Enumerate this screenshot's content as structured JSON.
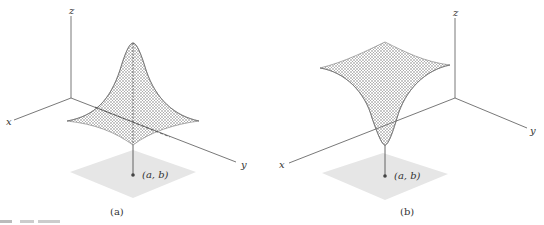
{
  "figure": {
    "panels": [
      {
        "id": "a",
        "caption": "(a)",
        "type": "surface-maximum",
        "axis_labels": {
          "x": "x",
          "y": "y",
          "z": "z"
        },
        "point_label": "(a, b)"
      },
      {
        "id": "b",
        "caption": "(b)",
        "type": "surface-minimum",
        "axis_labels": {
          "x": "x",
          "y": "y",
          "z": "z"
        },
        "point_label": "(a, b)"
      }
    ],
    "colors": {
      "axis": "#555555",
      "mesh": "#7a7a7a",
      "plane": "#e6e6e6",
      "point": "#444444"
    }
  }
}
